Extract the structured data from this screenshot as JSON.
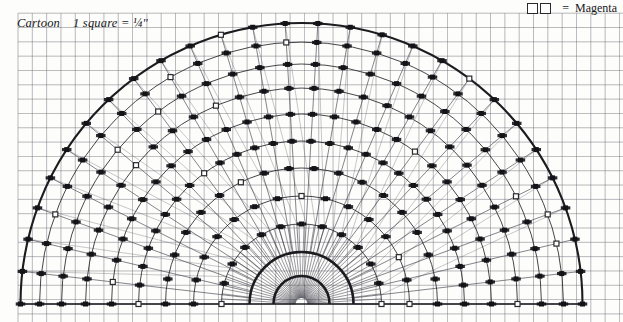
{
  "page": {
    "title": "Cartoon",
    "width": 623,
    "height": 322,
    "background": "#fdfdfb"
  },
  "caption": {
    "label": "Cartoon",
    "scale_text": "1 square = ¼\"",
    "full_text": "Cartoon   1 square = ¼\""
  },
  "legend": {
    "equals_sign": "=",
    "symbol_name": "open-square-pair",
    "symbol_count": 2,
    "label": "Magenta",
    "symbol_fill": "#ffffff",
    "symbol_stroke": "#2a2a2e"
  },
  "grid": {
    "square_label": "1 square",
    "square_size_inches": "¼\"",
    "spacing_px": 14.32,
    "origin_x": 18.0,
    "origin_y": 13.2,
    "color": "#5a5a66",
    "minor_opacity": 0.55,
    "cols": 43,
    "rows": 22
  },
  "chart_data": {
    "type": "scatter",
    "title": "Cartoon",
    "subtitle": "1 square = ¼\"",
    "xlabel": "",
    "ylabel": "",
    "coordinate_system": "polar-semicircle",
    "center": {
      "x": 301.5,
      "y": 304.0
    },
    "angle_range_deg": [
      0,
      180
    ],
    "grid": true,
    "legend_position": "top-right",
    "legend": [
      {
        "marker": "open-square",
        "color": "#ffffff",
        "stroke": "#2a2a2e",
        "label": "Magenta"
      },
      {
        "marker": "filled-square",
        "color": "#141418",
        "stroke": "#141418",
        "label": ""
      }
    ],
    "arcs": {
      "count": 11,
      "radii": [
        28.0,
        52.0,
        80.0,
        108.0,
        136.0,
        163.0,
        190.0,
        216.0,
        240.0,
        262.0,
        281.0
      ],
      "heavy_arc_indices": [
        0,
        1,
        10
      ],
      "color": "#1b1b20"
    },
    "spokes": {
      "outer_count": 27,
      "outer_angle_step_deg": 6.92,
      "inner_count": 49,
      "inner_angle_step_deg": 3.67,
      "inner_radius_limit": 80.0,
      "color": "#3a3a46"
    },
    "markers": {
      "filled_count": 168,
      "open_count": 23,
      "filled_color": "#141418",
      "open_color": "#ffffff",
      "open_stroke": "#2a2a2e",
      "shape": "square",
      "size_px": 5.0,
      "description": "Stitch positions at intersections of concentric arcs and radial spokes"
    },
    "series": [
      {
        "name": "Black stitches",
        "marker": "filled-square",
        "values": [
          168
        ]
      },
      {
        "name": "Magenta stitches",
        "marker": "open-square",
        "values": [
          23
        ]
      }
    ],
    "baseline": {
      "y": 304.0,
      "x_start": 22.0,
      "x_end": 581.0,
      "color": "#1b1b20"
    }
  }
}
